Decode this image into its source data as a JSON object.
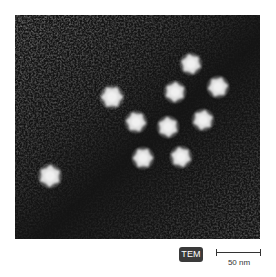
{
  "figure": {
    "type": "transmission electron micrograph",
    "particle_count": 10,
    "particles": [
      {
        "x": 112,
        "y": 97,
        "r": 12
      },
      {
        "x": 191,
        "y": 64,
        "r": 11
      },
      {
        "x": 175,
        "y": 92,
        "r": 11
      },
      {
        "x": 218,
        "y": 87,
        "r": 11
      },
      {
        "x": 136,
        "y": 122,
        "r": 11
      },
      {
        "x": 168,
        "y": 127,
        "r": 11
      },
      {
        "x": 203,
        "y": 120,
        "r": 11
      },
      {
        "x": 143,
        "y": 158,
        "r": 11
      },
      {
        "x": 181,
        "y": 157,
        "r": 11
      },
      {
        "x": 50,
        "y": 176,
        "r": 12
      }
    ],
    "colors": {
      "background_dark": "#141414",
      "background_grain": "#3a3a3a",
      "particle": "#e8e8e8"
    }
  },
  "badge": {
    "label": "TEM"
  },
  "scale_bar": {
    "label": "50 nm"
  }
}
